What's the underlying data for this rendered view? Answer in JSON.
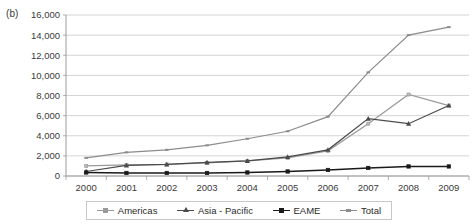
{
  "figure": {
    "panel_label": "(b)"
  },
  "legend": {
    "position": "bottom",
    "entries": [
      {
        "label": "Americas",
        "color": "#9a9a9a",
        "marker": "square"
      },
      {
        "label": "Asia - Pacific",
        "color": "#4a4a4a",
        "marker": "triangle"
      },
      {
        "label": "EAME",
        "color": "#1a1a1a",
        "marker": "square"
      },
      {
        "label": "Total",
        "color": "#8c8c8c",
        "marker": "dash"
      }
    ]
  },
  "chart_data": {
    "type": "line",
    "title": "",
    "xlabel": "",
    "ylabel": "",
    "grid": true,
    "legend_position": "bottom",
    "categories": [
      "2000",
      "2001",
      "2002",
      "2003",
      "2004",
      "2005",
      "2006",
      "2007",
      "2008",
      "2009"
    ],
    "x": [
      2000,
      2001,
      2002,
      2003,
      2004,
      2005,
      2006,
      2007,
      2008,
      2009
    ],
    "ylim": [
      0,
      16000
    ],
    "yticks": [
      0,
      2000,
      4000,
      6000,
      8000,
      10000,
      12000,
      14000,
      16000
    ],
    "ytick_labels": [
      "0",
      "2,000",
      "4,000",
      "6,000",
      "8,000",
      "10,000",
      "12,000",
      "14,000",
      "16,000"
    ],
    "series": [
      {
        "name": "Americas",
        "color": "#9a9a9a",
        "marker": "square",
        "values": [
          1000,
          1100,
          1150,
          1300,
          1500,
          1800,
          2500,
          5200,
          8100,
          7000
        ]
      },
      {
        "name": "Asia - Pacific",
        "color": "#4a4a4a",
        "marker": "triangle",
        "values": [
          450,
          1050,
          1150,
          1350,
          1500,
          1900,
          2600,
          5700,
          5200,
          7000
        ]
      },
      {
        "name": "EAME",
        "color": "#1a1a1a",
        "marker": "square",
        "values": [
          350,
          300,
          300,
          300,
          350,
          450,
          600,
          800,
          950,
          950
        ]
      },
      {
        "name": "Total",
        "color": "#8c8c8c",
        "marker": "dash",
        "values": [
          1800,
          2350,
          2600,
          3050,
          3700,
          4450,
          5900,
          10300,
          14000,
          14800
        ]
      }
    ]
  }
}
